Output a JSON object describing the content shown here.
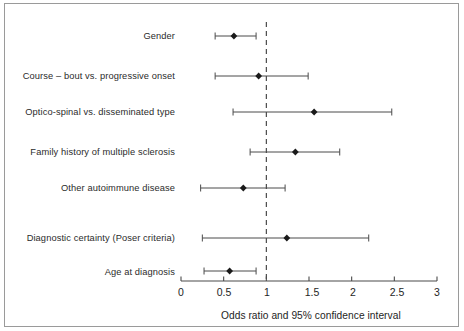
{
  "chart_data": {
    "type": "scatter",
    "subtype": "forest-plot",
    "title": "",
    "xlabel": "Odds ratio and 95% confidence interval",
    "ylabel": "",
    "xlim": [
      0,
      3
    ],
    "xticks": [
      0,
      0.5,
      1,
      1.5,
      2,
      2.5,
      3
    ],
    "xtick_labels": [
      "0",
      "0.5",
      "1",
      "1.5",
      "2",
      "2.5",
      "3"
    ],
    "grid": false,
    "legend": null,
    "reference_line": {
      "value": 1,
      "style": "dashed",
      "color": "#3a3a3a",
      "label": "null effect (OR = 1)"
    },
    "marker": {
      "shape": "diamond",
      "color": "#1a1a1a"
    },
    "error_bar": {
      "color": "#4a4a4a",
      "cap": "tick"
    },
    "categories": [
      "Gender",
      "Course – bout vs. progressive onset",
      "Optico-spinal vs. disseminated  type",
      "Family history of multiple sclerosis",
      "Other autoimmune disease",
      "Diagnostic certainty (Poser criteria)",
      "Age at diagnosis"
    ],
    "points": [
      {
        "label": "Gender",
        "odds_ratio": 0.62,
        "ci_low": 0.4,
        "ci_high": 0.88
      },
      {
        "label": "Course – bout vs. progressive onset",
        "odds_ratio": 0.91,
        "ci_low": 0.4,
        "ci_high": 1.49
      },
      {
        "label": "Optico-spinal vs. disseminated  type",
        "odds_ratio": 1.56,
        "ci_low": 0.61,
        "ci_high": 2.47
      },
      {
        "label": "Family history of multiple sclerosis",
        "odds_ratio": 1.34,
        "ci_low": 0.81,
        "ci_high": 1.86
      },
      {
        "label": "Other autoimmune disease",
        "odds_ratio": 0.73,
        "ci_low": 0.23,
        "ci_high": 1.22
      },
      {
        "label": "Diagnostic certainty (Poser criteria)",
        "odds_ratio": 1.24,
        "ci_low": 0.25,
        "ci_high": 2.2
      },
      {
        "label": "Age at diagnosis",
        "odds_ratio": 0.57,
        "ci_low": 0.27,
        "ci_high": 0.88
      }
    ]
  },
  "axis": {
    "title": "Odds ratio and 95% confidence interval",
    "tick_labels": [
      "0",
      "0.5",
      "1",
      "1.5",
      "2",
      "2.5",
      "3"
    ]
  },
  "labels": {
    "row_0": "Gender",
    "row_1": "Course – bout vs. progressive onset",
    "row_2": "Optico-spinal vs. disseminated  type",
    "row_3": "Family history of multiple sclerosis",
    "row_4": "Other autoimmune disease",
    "row_5": "Diagnostic certainty (Poser criteria)",
    "row_6": "Age at diagnosis"
  },
  "colors": {
    "marker": "#1a1a1a",
    "error_bar": "#4a4a4a",
    "axis": "#4a4a4a",
    "reference_line": "#3a3a3a",
    "frame": "#9a9a9a",
    "text": "#1e1e1e",
    "background": "#ffffff"
  }
}
